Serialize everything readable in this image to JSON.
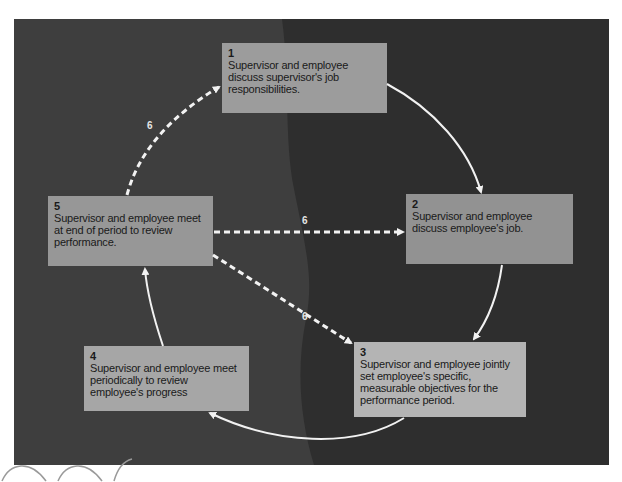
{
  "diagram": {
    "type": "cycle",
    "colors": {
      "background_dark": "#2e2e2e",
      "background_light_region": "#3d3d3d",
      "box_fill": "#9c9c9c",
      "box_text": "#1a1a1a",
      "arrow": "#f2f2f2",
      "label": "#e6e6e6"
    },
    "steps": [
      {
        "number": "1",
        "text": "Supervisor and employee discuss supervisor's job responsibilities."
      },
      {
        "number": "2",
        "text": "Supervisor and employee discuss employee's job."
      },
      {
        "number": "3",
        "text": "Supervisor and employee jointly set employee's specific, measurable objectives for the performance period."
      },
      {
        "number": "4",
        "text": "Supervisor and employee meet periodically to review employee's progress"
      },
      {
        "number": "5",
        "text": "Supervisor and employee meet at end of period to review performance."
      }
    ],
    "edges": [
      {
        "from": "1",
        "to": "2",
        "style": "solid"
      },
      {
        "from": "2",
        "to": "3",
        "style": "solid"
      },
      {
        "from": "3",
        "to": "4",
        "style": "solid"
      },
      {
        "from": "4",
        "to": "5",
        "style": "solid"
      },
      {
        "from": "5",
        "to": "1",
        "style": "dashed",
        "label": "6"
      },
      {
        "from": "5",
        "to": "2",
        "style": "dashed",
        "label": "6"
      },
      {
        "from": "5",
        "to": "3",
        "style": "dashed",
        "label": "6"
      }
    ],
    "dashed_labels": [
      "6",
      "6",
      "6"
    ]
  }
}
